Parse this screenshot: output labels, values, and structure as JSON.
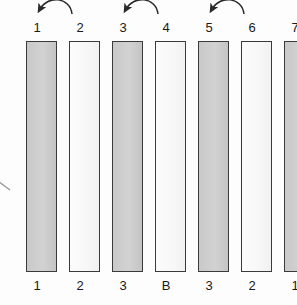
{
  "diagram": {
    "background_color": "#fdfdfd",
    "bar_outline_color": "#3a3a3a",
    "gray_fill_color": "#cdcdcd",
    "white_fill_color": "#fafafa",
    "arrow_color": "#2b2b2b",
    "top_labels": [
      "1",
      "2",
      "3",
      "4",
      "5",
      "6",
      "7"
    ],
    "bottom_labels": [
      "1",
      "2",
      "3",
      "B",
      "3",
      "2",
      "1"
    ],
    "bars": [
      {
        "index": 1,
        "fill": "gray",
        "top_label": "1",
        "bottom_label": "1"
      },
      {
        "index": 2,
        "fill": "white",
        "top_label": "2",
        "bottom_label": "2"
      },
      {
        "index": 3,
        "fill": "gray",
        "top_label": "3",
        "bottom_label": "3"
      },
      {
        "index": 4,
        "fill": "white",
        "top_label": "4",
        "bottom_label": "B"
      },
      {
        "index": 5,
        "fill": "gray",
        "top_label": "5",
        "bottom_label": "3"
      },
      {
        "index": 6,
        "fill": "white",
        "top_label": "6",
        "bottom_label": "2"
      },
      {
        "index": 7,
        "fill": "gray",
        "top_label": "7",
        "bottom_label": "1"
      }
    ],
    "arrows": [
      {
        "id": "arrow-2-to-1",
        "from_label": "2",
        "to_label": "1"
      },
      {
        "id": "arrow-4-to-3",
        "from_label": "4",
        "to_label": "3"
      },
      {
        "id": "arrow-6-to-5",
        "from_label": "6",
        "to_label": "5"
      },
      {
        "id": "arrow-left-edge",
        "from_label": "",
        "to_label": ""
      }
    ]
  }
}
